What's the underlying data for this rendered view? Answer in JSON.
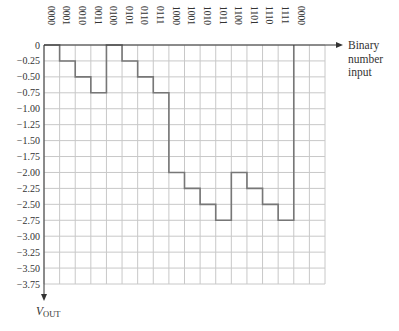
{
  "chart_data": {
    "type": "line",
    "subtype": "step",
    "title": "",
    "xlabel": "Binary number input",
    "xlabel_lines": [
      "Binary",
      "number",
      "input"
    ],
    "ylabel": "VOUT",
    "ylabel_main": "V",
    "ylabel_sub": "OUT",
    "categories": [
      "0000",
      "0001",
      "0010",
      "0011",
      "0100",
      "0101",
      "0110",
      "0111",
      "1000",
      "1001",
      "1010",
      "1011",
      "1100",
      "1101",
      "1110",
      "1111",
      "0000"
    ],
    "values": [
      0,
      -0.25,
      -0.5,
      -0.75,
      0,
      -0.25,
      -0.5,
      -0.75,
      -2.0,
      -2.25,
      -2.5,
      -2.75,
      -2.0,
      -2.25,
      -2.5,
      -2.75,
      0
    ],
    "ylim": [
      -3.75,
      0
    ],
    "y_ticks": [
      "0",
      "-0.25",
      "-0.50",
      "-0.75",
      "-1.00",
      "-1.25",
      "-1.50",
      "-1.75",
      "-2.00",
      "-2.25",
      "-2.50",
      "-2.75",
      "-3.00",
      "-3.25",
      "-3.50",
      "-3.75"
    ],
    "grid": true,
    "grid_columns": 18,
    "grid_rows": 15,
    "legend": null,
    "colors": {
      "line": "#777777",
      "grid": "#c8c8c8",
      "axis": "#333333"
    }
  }
}
